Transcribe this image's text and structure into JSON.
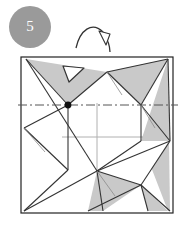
{
  "figure": {
    "kind": "origami-fold-diagram",
    "step_badge": {
      "label": "5",
      "fill_color": "#9a9a9a",
      "text_color": "#ffffff",
      "cx": 30,
      "cy": 27,
      "r": 21
    },
    "paper": {
      "outline_color": "#222222",
      "face_color": "#ffffff",
      "shaded_color": "#c9c9c9",
      "shaded_color_dark": "#b4b4b4",
      "x": 21,
      "y": 57,
      "width": 152,
      "height": 156
    },
    "guides": {
      "dash_dot_line_color": "#555555",
      "thin_cross_color": "#b0b0b0",
      "dash_dot_y": 105,
      "cross_vertical_x": 97,
      "cross_horizontal_y": 137
    },
    "markers": {
      "pivot_dot_color": "#111111",
      "pivot_dot_x": 68,
      "pivot_dot_y": 105,
      "pivot_dot_r": 3.4
    },
    "arrow": {
      "name": "fold-arrow",
      "stroke_color": "#333333",
      "head_fill": "#ffffff",
      "description": "curved fold arrow from upper right arcing down to the left"
    },
    "shaded_polygons": [
      {
        "name": "top-left-flap",
        "points": "26,59 107,72 68,105"
      },
      {
        "name": "top-right-corner-flap",
        "points": "107,72 168,59 141,105"
      },
      {
        "name": "right-mid-flap",
        "points": "141,105 168,59 168,140 141,140"
      },
      {
        "name": "left-mid-flap",
        "points": "24,128 68,105 68,170 24,170"
      },
      {
        "name": "bottom-center-flap",
        "points": "97,171 141,185 97,211"
      },
      {
        "name": "bottom-right-flap",
        "points": "141,185 168,140 168,211"
      }
    ],
    "crease_lines": [
      {
        "name": "crease-top-left-long",
        "d": "M26,59 L68,105"
      },
      {
        "name": "crease-top-left-to-dot",
        "d": "M26,59 L97,171"
      },
      {
        "name": "crease-top-to-right",
        "d": "M68,105 L168,59"
      },
      {
        "name": "crease-right-down",
        "d": "M168,59 L141,105"
      },
      {
        "name": "crease-right-to-mid",
        "d": "M141,105 L168,140"
      },
      {
        "name": "crease-left-flap-edge",
        "d": "M24,128 L68,105"
      },
      {
        "name": "crease-left-down",
        "d": "M68,105 L24,211"
      },
      {
        "name": "crease-bottom-center",
        "d": "M97,171 L141,185"
      },
      {
        "name": "crease-bottom-right",
        "d": "M141,185 L168,211"
      },
      {
        "name": "crease-bottom-left",
        "d": "M24,211 L141,185"
      },
      {
        "name": "crease-star-right",
        "d": "M141,140 L97,171"
      },
      {
        "name": "crease-star-right2",
        "d": "M168,140 L97,171"
      }
    ]
  }
}
